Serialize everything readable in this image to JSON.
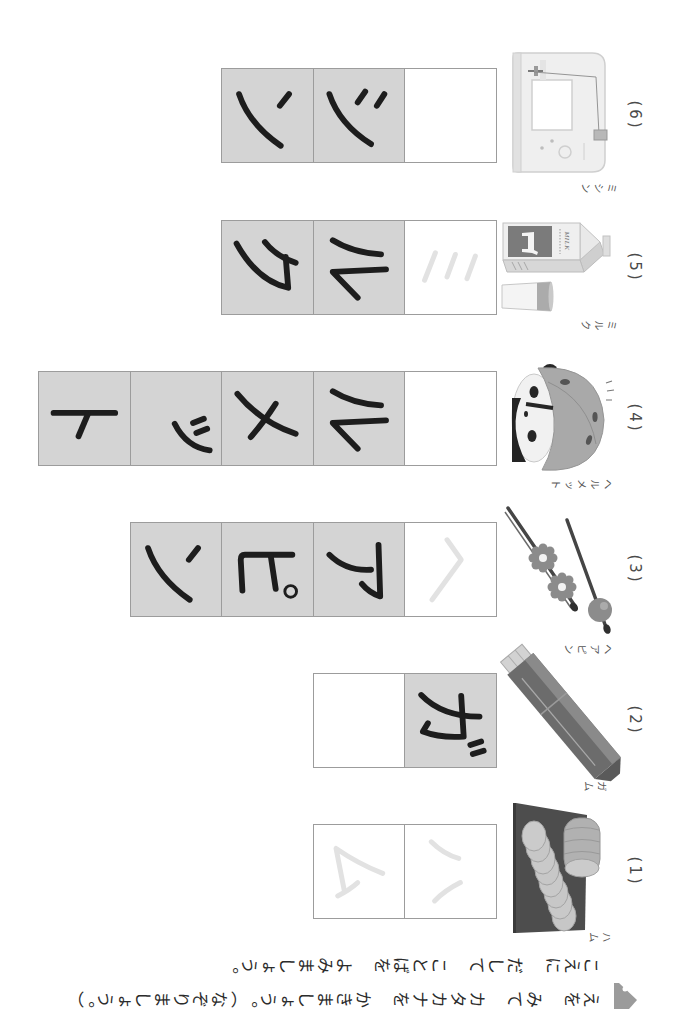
{
  "worksheet": {
    "instruction_icon": "pencil-icon",
    "instruction_line_1": "えを　みて　カタカナを　かきましょう。（なぞりましょう。）",
    "instruction_line_2": "こえに　だして　ことばを　よみましょう。"
  },
  "colors": {
    "cell_fill": "#d4d4d4",
    "cell_border": "#9c9c9c",
    "ink": "#1d1d1d",
    "trace": "#e2e2e2",
    "label": "#4a4a4a"
  },
  "items": [
    {
      "number": "(1)",
      "reading": "ハム",
      "picture": "ham",
      "cells": [
        {
          "char": "ハ",
          "type": "trace"
        },
        {
          "char": "ム",
          "type": "trace"
        }
      ]
    },
    {
      "number": "(2)",
      "reading": "ガム",
      "picture": "gum",
      "cells": [
        {
          "char": "ガ",
          "type": "solid"
        },
        {
          "char": "",
          "type": "blank"
        }
      ]
    },
    {
      "number": "(3)",
      "reading": "ヘアピン",
      "picture": "hairpins",
      "cells": [
        {
          "char": "ヘ",
          "type": "trace"
        },
        {
          "char": "ア",
          "type": "solid"
        },
        {
          "char": "ピ",
          "type": "solid"
        },
        {
          "char": "ン",
          "type": "solid"
        }
      ]
    },
    {
      "number": "(4)",
      "reading": "ヘルメット",
      "picture": "helmet",
      "cells": [
        {
          "char": "",
          "type": "blank"
        },
        {
          "char": "ル",
          "type": "solid"
        },
        {
          "char": "メ",
          "type": "solid"
        },
        {
          "char": "ッ",
          "type": "solid"
        },
        {
          "char": "ト",
          "type": "solid"
        }
      ]
    },
    {
      "number": "(5)",
      "reading": "ミルク",
      "picture": "milk carton and glass",
      "picture_text": "MILK",
      "cells": [
        {
          "char": "ミ",
          "type": "trace"
        },
        {
          "char": "ル",
          "type": "solid"
        },
        {
          "char": "ク",
          "type": "solid"
        }
      ]
    },
    {
      "number": "(6)",
      "reading": "ミシン",
      "picture": "sewing machine",
      "cells": [
        {
          "char": "",
          "type": "blank"
        },
        {
          "char": "シ",
          "type": "solid"
        },
        {
          "char": "ン",
          "type": "solid"
        }
      ]
    }
  ]
}
